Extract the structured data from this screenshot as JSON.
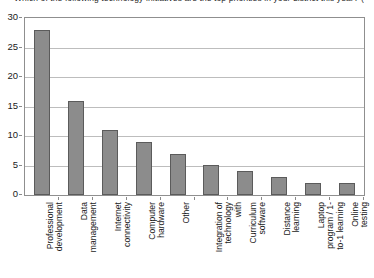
{
  "chart_data": {
    "type": "bar",
    "title": "Which of the following technology initiatives are the top priorities in your district this year? (Check all that apply.)",
    "title_cropped": true,
    "xlabel": "",
    "ylabel": "",
    "ylim": [
      0,
      30
    ],
    "yticks": [
      0,
      5,
      10,
      15,
      20,
      25,
      30
    ],
    "grid": true,
    "legend": "none",
    "bar_color": "#8c8c8c",
    "bar_border_color": "#5b5b5b",
    "categories": [
      "Professional development",
      "Data management",
      "Internet connectivity",
      "Computer hardware",
      "Other",
      "Integration of technology with",
      "Curriculum software",
      "Distance learning",
      "Laptop program / 1-to-1 learning",
      "Online testing"
    ],
    "category_lines": [
      [
        "Professional",
        "development"
      ],
      [
        "Data",
        "management"
      ],
      [
        "Internet",
        "connectivity"
      ],
      [
        "Computer",
        "hardware"
      ],
      [
        "Other"
      ],
      [
        "Integration of",
        "technology",
        "with"
      ],
      [
        "Curriculum",
        "software"
      ],
      [
        "Distance",
        "learning"
      ],
      [
        "Laptop",
        "program / 1-",
        "to-1 learning"
      ],
      [
        "Online",
        "testing"
      ]
    ],
    "values": [
      28,
      16,
      11,
      9,
      7,
      5,
      4,
      3,
      2,
      2
    ]
  }
}
